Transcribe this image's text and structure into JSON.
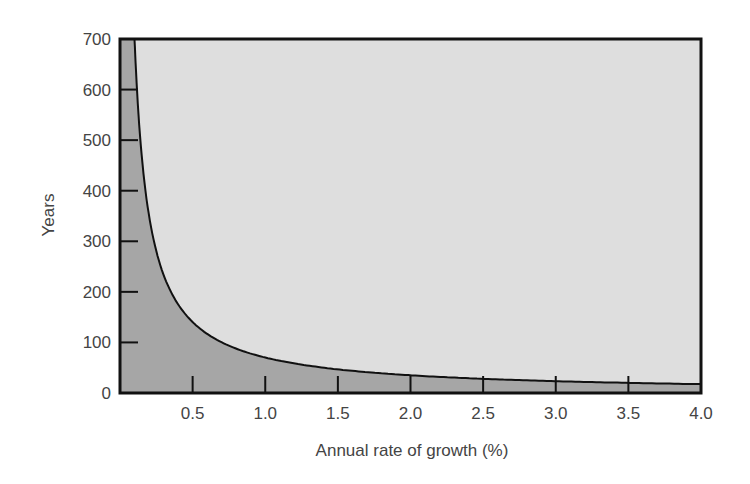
{
  "chart_data": {
    "type": "area",
    "title": "",
    "xlabel": "Annual rate of growth (%)",
    "ylabel": "Years",
    "xlim": [
      0.0,
      4.0
    ],
    "ylim": [
      0,
      700
    ],
    "grid": false,
    "legend": null,
    "x_ticks": [
      0.5,
      1.0,
      1.5,
      2.0,
      2.5,
      3.0,
      3.5
    ],
    "x_tick_labels": [
      "0.5",
      "1.0",
      "1.5",
      "2.0",
      "2.5",
      "3.0",
      "3.5",
      "4.0"
    ],
    "y_ticks": [
      0,
      100,
      200,
      300,
      400,
      500,
      600,
      700
    ],
    "y_tick_labels": [
      "0",
      "100",
      "200",
      "300",
      "400",
      "500",
      "600",
      "700"
    ],
    "series": [
      {
        "name": "Doubling time (years)",
        "x": [
          0.1,
          0.15,
          0.2,
          0.25,
          0.3,
          0.4,
          0.5,
          0.6,
          0.8,
          1.0,
          1.5,
          2.0,
          2.5,
          3.0,
          3.5,
          4.0
        ],
        "values": [
          700,
          467,
          350,
          280,
          233,
          175,
          140,
          117,
          88,
          70,
          47,
          35,
          28,
          23,
          20,
          18
        ]
      }
    ],
    "colors": {
      "under_curve": "#a6a6a6",
      "above_curve": "#dedede",
      "line": "#111111",
      "frame": "#111111"
    }
  }
}
